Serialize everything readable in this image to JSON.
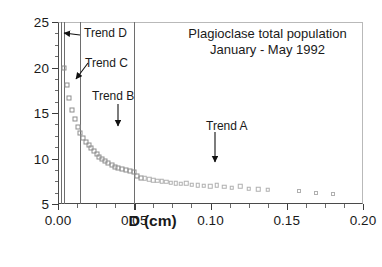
{
  "chart_data": {
    "type": "scatter",
    "title": "Plagioclase total population\nJanuary - May 1992",
    "title_lines": [
      "Plagioclase total population",
      "January - May 1992"
    ],
    "xlabel": "D (cm)",
    "ylabel": "Ln (N(L))",
    "xlim": [
      0.0,
      0.2
    ],
    "ylim": [
      5,
      25
    ],
    "xticks": [
      0.0,
      0.05,
      0.1,
      0.15,
      0.2
    ],
    "xtick_labels": [
      "0.00",
      "0.05",
      "0.10",
      "0.15",
      "0.20"
    ],
    "xminor_step": 0.0125,
    "yticks": [
      5,
      10,
      15,
      20,
      25
    ],
    "ytick_labels": [
      "5",
      "10",
      "15",
      "20",
      "25"
    ],
    "yminor_step": 1.25,
    "grid": false,
    "legend": null,
    "marker": "open-square",
    "marker_color": "#9a9a9a",
    "vertical_lines": [
      0.0018,
      0.0042,
      0.0145,
      0.0497
    ],
    "series": [
      {
        "name": "Plagioclase crystal size distribution",
        "x": [
          0.0042,
          0.0058,
          0.0075,
          0.0092,
          0.011,
          0.0128,
          0.0146,
          0.0164,
          0.0182,
          0.02,
          0.0218,
          0.0236,
          0.0254,
          0.0272,
          0.029,
          0.031,
          0.033,
          0.0352,
          0.0374,
          0.0396,
          0.042,
          0.0444,
          0.047,
          0.0497,
          0.052,
          0.0545,
          0.057,
          0.0597,
          0.0624,
          0.0652,
          0.068,
          0.071,
          0.074,
          0.0772,
          0.0805,
          0.084,
          0.0876,
          0.0915,
          0.0955,
          0.0998,
          0.1042,
          0.109,
          0.114,
          0.1195,
          0.1252,
          0.1312,
          0.1375,
          0.158,
          0.169,
          0.18
        ],
        "y": [
          19.95,
          18.05,
          16.65,
          15.3,
          14.3,
          13.45,
          12.85,
          12.25,
          11.85,
          11.45,
          11.1,
          10.8,
          10.5,
          10.2,
          9.95,
          9.7,
          9.48,
          9.28,
          9.1,
          8.95,
          8.82,
          8.72,
          8.62,
          8.52,
          8.05,
          7.9,
          7.85,
          7.7,
          7.62,
          7.55,
          7.48,
          7.42,
          7.35,
          7.28,
          7.22,
          7.28,
          7.12,
          7.05,
          7.0,
          6.95,
          7.05,
          6.9,
          6.8,
          6.95,
          6.68,
          6.6,
          6.55,
          6.38,
          6.18,
          6.1
        ]
      }
    ],
    "annotations": [
      {
        "label": "Trend D",
        "text_x_px": 84,
        "text_y_px": 33,
        "arrow": "left",
        "target_x": 0.0042,
        "target_y": 22.3
      },
      {
        "label": "Trend C",
        "text_x_px": 85,
        "text_y_px": 62,
        "arrow": "down-left",
        "target_x": 0.013,
        "target_y": 18.0
      },
      {
        "label": "Trend B",
        "text_x_px": 92,
        "text_y_px": 92,
        "arrow": "down",
        "target_x": 0.031,
        "target_y": 13.0
      },
      {
        "label": "Trend A",
        "text_x_px": 205,
        "text_y_px": 120,
        "arrow": "down",
        "target_x": 0.102,
        "target_y": 9.2
      }
    ]
  },
  "figure": {
    "title_line_1": "Plagioclase total population",
    "title_line_2": "January - May 1992",
    "axis_x_title": "D (cm)",
    "axis_y_title": "Ln (N(L))",
    "trend_a_label": "Trend A",
    "trend_b_label": "Trend B",
    "trend_c_label": "Trend C",
    "trend_d_label": "Trend D"
  }
}
